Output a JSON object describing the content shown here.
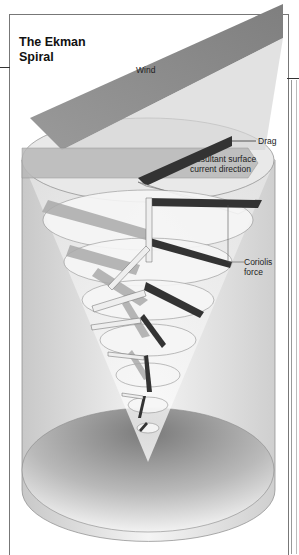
{
  "title": {
    "line1": "The Ekman",
    "line2": "Spiral"
  },
  "labels": {
    "wind": "Wind",
    "drag": "Drag",
    "resultant_line1": "Resultant surface",
    "resultant_line2": "current direction",
    "coriolis_line1": "Coriolis",
    "coriolis_line2": "force"
  },
  "colors": {
    "wind_band": "#8f8f8f",
    "drag_bar": "#3a3a3a",
    "current_bar": "#e8e8e8",
    "layer_arrow": "#a8a8a8",
    "disk_fill": "#f4f4f4",
    "base_shadow": "#8a8a8a"
  }
}
